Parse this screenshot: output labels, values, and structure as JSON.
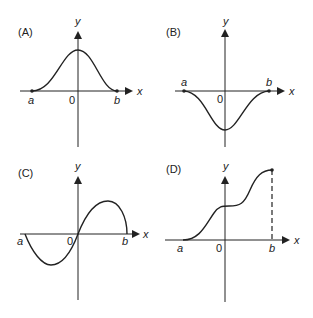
{
  "panels": [
    {
      "id": "A",
      "label": "(A)",
      "x_axis": "x",
      "y_axis": "y",
      "origin": "0",
      "a": "a",
      "b": "b",
      "description": "bell-shaped curve above x-axis from a to b, peak at x=0"
    },
    {
      "id": "B",
      "label": "(B)",
      "x_axis": "x",
      "y_axis": "y",
      "origin": "0",
      "a": "a",
      "b": "b",
      "description": "inverted bell curve below x-axis from a to b, minimum at x=0"
    },
    {
      "id": "C",
      "label": "(C)",
      "x_axis": "x",
      "y_axis": "y",
      "origin": "0",
      "a": "a",
      "b": "b",
      "description": "odd function: negative lobe between a and 0, positive lobe between 0 and b"
    },
    {
      "id": "D",
      "label": "(D)",
      "x_axis": "x",
      "y_axis": "y",
      "origin": "0",
      "a": "a",
      "b": "b",
      "description": "increasing S-curve from a, plateau near x=0, rising to endpoint at b with dashed vertical line"
    }
  ],
  "colors": {
    "stroke": "#222222",
    "background": "#ffffff"
  }
}
